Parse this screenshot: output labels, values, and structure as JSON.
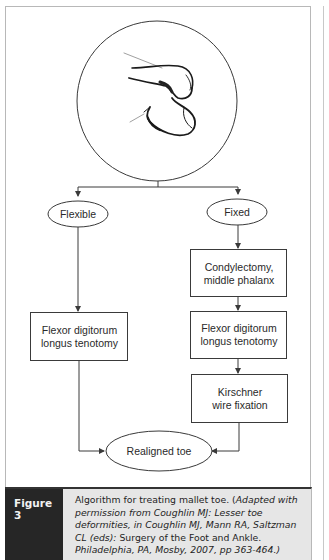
{
  "figure": {
    "illustration": "mallet-toe-drawing",
    "nodes": {
      "flexible": "Flexible",
      "fixed": "Fixed",
      "left_tenotomy_l1": "Flexor digitorum",
      "left_tenotomy_l2": "longus tenotomy",
      "condylectomy_l1": "Condylectomy,",
      "condylectomy_l2": "middle phalanx",
      "right_tenotomy_l1": "Flexor digitorum",
      "right_tenotomy_l2": "longus tenotomy",
      "kirschner_l1": "Kirschner",
      "kirschner_l2": "wire fixation",
      "realigned": "Realigned toe"
    },
    "edges": [
      {
        "from": "illustration",
        "to": "flexible"
      },
      {
        "from": "illustration",
        "to": "fixed"
      },
      {
        "from": "flexible",
        "to": "left_tenotomy"
      },
      {
        "from": "fixed",
        "to": "condylectomy"
      },
      {
        "from": "condylectomy",
        "to": "right_tenotomy"
      },
      {
        "from": "right_tenotomy",
        "to": "kirschner"
      },
      {
        "from": "left_tenotomy",
        "to": "realigned"
      },
      {
        "from": "kirschner",
        "to": "realigned"
      }
    ]
  },
  "caption": {
    "label": "Figure 3",
    "seg1": "Algorithm for treating mallet toe. (",
    "seg2_italic": "Adapted with permission from Coughlin MJ: Lesser toe deformities, in Coughlin MJ, Mann RA, Saltzman CL (eds):",
    "seg3": " Surgery of the Foot and Ankle. ",
    "seg4_italic": "Philadelphia, PA, Mosby, 2007, pp 363-464.)"
  },
  "colors": {
    "label_bg": "#262626",
    "caption_bg": "#e6e6e6",
    "line": "#3a3a3a"
  }
}
